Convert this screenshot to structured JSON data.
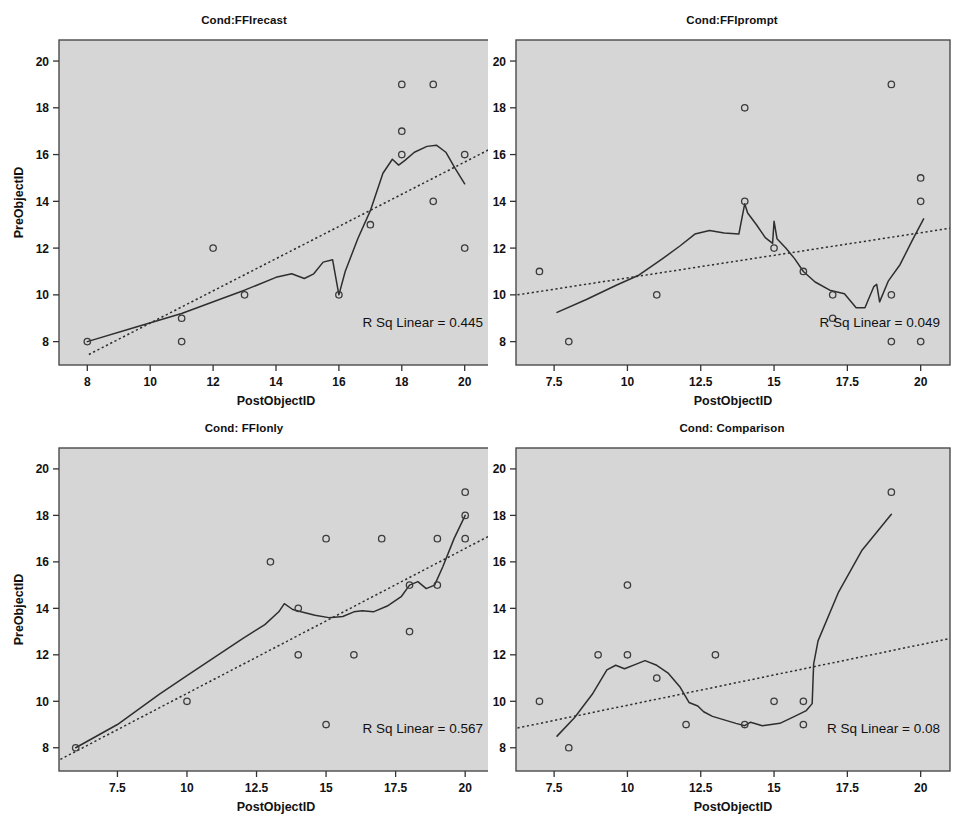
{
  "figure": {
    "background": "#ffffff",
    "plot_background": "#d6d6d6",
    "line_color": "#2e2e2e",
    "marker_color": "#3c3c3c",
    "panel_count": 4
  },
  "chart_data": [
    {
      "type": "scatter",
      "title": "Cond:FFIrecast",
      "xlabel": "PostObjectID",
      "ylabel": "PreObjectID",
      "xlim": [
        7.1,
        20.9
      ],
      "ylim": [
        7.0,
        20.9
      ],
      "xticks": [
        8,
        10,
        12,
        14,
        16,
        18,
        20
      ],
      "xtick_labels": [
        "8",
        "10",
        "12",
        "14",
        "16",
        "18",
        "20"
      ],
      "yticks": [
        8,
        10,
        12,
        14,
        16,
        18,
        20
      ],
      "ytick_labels": [
        "8",
        "10",
        "12",
        "14",
        "16",
        "18",
        "20"
      ],
      "grid": false,
      "annotation": "R Sq Linear = 0.445",
      "r_sq_linear": 0.445,
      "points": [
        [
          8,
          8
        ],
        [
          11,
          9
        ],
        [
          11,
          8
        ],
        [
          12,
          12
        ],
        [
          13,
          10
        ],
        [
          16,
          10
        ],
        [
          17,
          13
        ],
        [
          18,
          19
        ],
        [
          18,
          17
        ],
        [
          18,
          16
        ],
        [
          19,
          19
        ],
        [
          19,
          14
        ],
        [
          20,
          16
        ],
        [
          20,
          12
        ]
      ],
      "fit_line": {
        "x": [
          8.05,
          20.9
        ],
        "y": [
          7.45,
          16.3
        ]
      },
      "loess_line": {
        "x": [
          8.0,
          9.5,
          11.0,
          12.2,
          13.0,
          14.0,
          14.5,
          14.9,
          15.2,
          15.5,
          15.8,
          16.0,
          16.2,
          16.6,
          17.0,
          17.4,
          17.7,
          17.9,
          18.1,
          18.4,
          18.8,
          19.1,
          19.4,
          19.7,
          20.0
        ],
        "y": [
          8.0,
          8.6,
          9.2,
          9.8,
          10.2,
          10.75,
          10.9,
          10.7,
          10.9,
          11.4,
          11.5,
          10.0,
          11.0,
          12.4,
          13.6,
          15.2,
          15.8,
          15.55,
          15.75,
          16.1,
          16.35,
          16.4,
          16.1,
          15.4,
          14.75
        ]
      }
    },
    {
      "type": "scatter",
      "title": "Cond:FFIprompt",
      "xlabel": "PostObjectID",
      "ylabel": "PreObjectID",
      "xlim": [
        6.2,
        21.0
      ],
      "ylim": [
        7.0,
        20.9
      ],
      "xticks": [
        7.5,
        10,
        12.5,
        15,
        17.5,
        20
      ],
      "xtick_labels": [
        "7.5",
        "10",
        "12.5",
        "15",
        "17.5",
        "20"
      ],
      "yticks": [
        8,
        10,
        12,
        14,
        16,
        18,
        20
      ],
      "ytick_labels": [
        "8",
        "10",
        "12",
        "14",
        "16",
        "18",
        "20"
      ],
      "grid": false,
      "annotation": "R Sq Linear = 0.049",
      "r_sq_linear": 0.049,
      "points": [
        [
          7,
          11
        ],
        [
          8,
          8
        ],
        [
          11,
          10
        ],
        [
          14,
          18
        ],
        [
          14,
          14
        ],
        [
          15,
          12
        ],
        [
          16,
          11
        ],
        [
          17,
          10
        ],
        [
          17,
          9
        ],
        [
          19,
          19
        ],
        [
          19,
          10
        ],
        [
          19,
          8
        ],
        [
          20,
          15
        ],
        [
          20,
          14
        ],
        [
          20,
          8
        ]
      ],
      "fit_line": {
        "x": [
          6.25,
          21.0
        ],
        "y": [
          10.0,
          12.85
        ]
      },
      "loess_line": {
        "x": [
          7.6,
          8.6,
          9.6,
          10.4,
          11.2,
          11.8,
          12.3,
          12.8,
          13.3,
          13.8,
          14.0,
          14.1,
          14.4,
          14.7,
          14.95,
          15.0,
          15.1,
          15.4,
          15.7,
          16.0,
          16.4,
          16.9,
          17.4,
          17.8,
          18.1,
          18.4,
          18.5,
          18.6,
          18.9,
          19.3,
          19.7,
          20.1
        ],
        "y": [
          9.25,
          9.8,
          10.4,
          10.85,
          11.55,
          12.1,
          12.6,
          12.75,
          12.65,
          12.6,
          13.9,
          13.5,
          13.0,
          12.45,
          12.2,
          13.15,
          12.4,
          12.0,
          11.55,
          11.0,
          10.55,
          10.2,
          10.05,
          9.45,
          9.45,
          10.35,
          10.45,
          9.7,
          10.6,
          11.3,
          12.3,
          13.25
        ]
      }
    },
    {
      "type": "scatter",
      "title": "Cond: FFIonly",
      "xlabel": "PostObjectID",
      "ylabel": "PreObjectID",
      "xlim": [
        5.4,
        21.0
      ],
      "ylim": [
        7.0,
        20.9
      ],
      "xticks": [
        7.5,
        10,
        12.5,
        15,
        17.5,
        20
      ],
      "xtick_labels": [
        "7.5",
        "10",
        "12.5",
        "15",
        "17.5",
        "20"
      ],
      "yticks": [
        8,
        10,
        12,
        14,
        16,
        18,
        20
      ],
      "ytick_labels": [
        "8",
        "10",
        "12",
        "14",
        "16",
        "18",
        "20"
      ],
      "grid": false,
      "annotation": "R Sq Linear = 0.567",
      "r_sq_linear": 0.567,
      "points": [
        [
          6,
          8
        ],
        [
          10,
          10
        ],
        [
          13,
          16
        ],
        [
          14,
          14
        ],
        [
          14,
          12
        ],
        [
          15,
          17
        ],
        [
          15,
          9
        ],
        [
          16,
          12
        ],
        [
          17,
          17
        ],
        [
          18,
          15
        ],
        [
          18,
          13
        ],
        [
          19,
          17
        ],
        [
          19,
          15
        ],
        [
          20,
          19
        ],
        [
          20,
          18
        ],
        [
          20,
          17
        ]
      ],
      "fit_line": {
        "x": [
          5.45,
          21.0
        ],
        "y": [
          7.5,
          17.2
        ]
      },
      "loess_line": {
        "x": [
          6.0,
          7.5,
          9.0,
          10.0,
          11.0,
          12.0,
          12.8,
          13.3,
          13.5,
          13.8,
          14.1,
          14.6,
          15.1,
          15.6,
          16.0,
          16.3,
          16.7,
          17.2,
          17.7,
          18.0,
          18.3,
          18.6,
          18.9,
          19.2,
          19.6,
          20.0
        ],
        "y": [
          8.0,
          9.0,
          10.3,
          11.1,
          11.9,
          12.7,
          13.3,
          13.85,
          14.2,
          13.95,
          13.85,
          13.7,
          13.6,
          13.65,
          13.85,
          13.9,
          13.85,
          14.1,
          14.5,
          15.0,
          15.15,
          14.85,
          15.0,
          15.8,
          17.0,
          18.0
        ]
      }
    },
    {
      "type": "scatter",
      "title": "Cond: Comparison",
      "xlabel": "PostObjectID",
      "ylabel": "PreObjectID",
      "xlim": [
        6.2,
        21.0
      ],
      "ylim": [
        7.0,
        20.9
      ],
      "xticks": [
        7.5,
        10,
        12.5,
        15,
        17.5,
        20
      ],
      "xtick_labels": [
        "7.5",
        "10",
        "12.5",
        "15",
        "17.5",
        "20"
      ],
      "yticks": [
        8,
        10,
        12,
        14,
        16,
        18,
        20
      ],
      "ytick_labels": [
        "8",
        "10",
        "12",
        "14",
        "16",
        "18",
        "20"
      ],
      "grid": false,
      "annotation": "R Sq Linear = 0.08",
      "r_sq_linear": 0.08,
      "points": [
        [
          7,
          10
        ],
        [
          8,
          8
        ],
        [
          9,
          12
        ],
        [
          10,
          15
        ],
        [
          10,
          12
        ],
        [
          11,
          11
        ],
        [
          12,
          9
        ],
        [
          13,
          12
        ],
        [
          14,
          9
        ],
        [
          15,
          10
        ],
        [
          16,
          10
        ],
        [
          16,
          9
        ],
        [
          19,
          19
        ]
      ],
      "fit_line": {
        "x": [
          6.25,
          21.0
        ],
        "y": [
          8.85,
          12.7
        ]
      },
      "loess_line": {
        "x": [
          7.6,
          8.2,
          8.8,
          9.3,
          9.6,
          9.9,
          10.3,
          10.6,
          11.0,
          11.4,
          11.8,
          12.1,
          12.4,
          12.6,
          12.9,
          13.3,
          13.7,
          14.0,
          14.2,
          14.6,
          15.2,
          15.7,
          16.1,
          16.3,
          16.35,
          16.5,
          17.2,
          18.0,
          19.0
        ],
        "y": [
          8.5,
          9.3,
          10.3,
          11.35,
          11.55,
          11.4,
          11.6,
          11.75,
          11.55,
          11.2,
          10.6,
          9.95,
          9.8,
          9.55,
          9.35,
          9.2,
          9.05,
          8.95,
          9.1,
          8.95,
          9.05,
          9.35,
          9.6,
          9.9,
          11.6,
          12.6,
          14.7,
          16.5,
          18.05
        ]
      }
    }
  ]
}
